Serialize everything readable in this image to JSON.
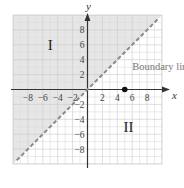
{
  "chart_data": {
    "type": "line",
    "title": "",
    "xlabel": "x",
    "ylabel": "y",
    "xlim": [
      -10,
      10
    ],
    "ylim": [
      -10,
      10
    ],
    "grid": true,
    "x_ticks": [
      -8,
      -6,
      -4,
      -2,
      2,
      4,
      6,
      8
    ],
    "y_ticks": [
      8,
      6,
      4,
      2,
      -2,
      -4,
      -6,
      -8
    ],
    "x_tick_labels": [
      "−8",
      "−6",
      "−4",
      "−2",
      "2",
      "4",
      "6",
      "8"
    ],
    "y_tick_labels": [
      "8",
      "6",
      "4",
      "2",
      "−2",
      "−4",
      "−6",
      "−8"
    ],
    "series": [
      {
        "name": "Boundary line",
        "style": "dashed",
        "equation": "y = x",
        "x": [
          -9.5,
          9.5
        ],
        "y": [
          -9.5,
          9.5
        ],
        "color": "#8a8a8a"
      }
    ],
    "points": [
      {
        "x": 5,
        "y": 0,
        "color": "#111111"
      }
    ],
    "shaded_region": {
      "description": "half-plane above the boundary line (y > x)",
      "color": "#e6e6e6"
    },
    "annotations": [
      {
        "text": "Boundary line",
        "x": 6,
        "y": 3
      },
      {
        "text": "I",
        "x": -5,
        "y": 6
      },
      {
        "text": "II",
        "x": 5.5,
        "y": -5
      }
    ],
    "colors": {
      "grid_minor": "#dcdcdc",
      "grid_major": "#c8c8c8",
      "axis": "#333333",
      "shade": "#e6e6e6",
      "background": "#ffffff"
    }
  }
}
